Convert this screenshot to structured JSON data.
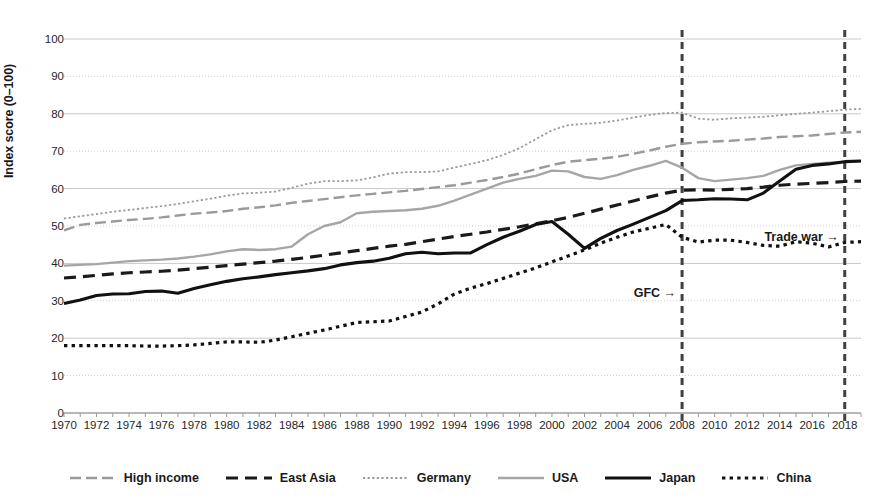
{
  "chart_data": {
    "type": "line",
    "title": "",
    "xlabel": "",
    "ylabel": "Index score (0–100)",
    "xlim": [
      1970,
      2019
    ],
    "ylim": [
      0,
      100
    ],
    "grid": true,
    "legend_position": "bottom",
    "x": [
      1970,
      1971,
      1972,
      1973,
      1974,
      1975,
      1976,
      1977,
      1978,
      1979,
      1980,
      1981,
      1982,
      1983,
      1984,
      1985,
      1986,
      1987,
      1988,
      1989,
      1990,
      1991,
      1992,
      1993,
      1994,
      1995,
      1996,
      1997,
      1998,
      1999,
      2000,
      2001,
      2002,
      2003,
      2004,
      2005,
      2006,
      2007,
      2008,
      2009,
      2010,
      2011,
      2012,
      2013,
      2014,
      2015,
      2016,
      2017,
      2018,
      2019
    ],
    "xticks": [
      1970,
      1972,
      1974,
      1976,
      1978,
      1980,
      1982,
      1984,
      1986,
      1988,
      1990,
      1992,
      1994,
      1996,
      1998,
      2000,
      2002,
      2004,
      2006,
      2008,
      2010,
      2012,
      2014,
      2016,
      2018
    ],
    "yticks": [
      0,
      10,
      20,
      30,
      40,
      50,
      60,
      70,
      80,
      90,
      100
    ],
    "series": [
      {
        "name": "High income",
        "style": "dash-long",
        "color": "#9a9a9a",
        "width": 2.4,
        "values": [
          48.8,
          50.3,
          50.8,
          51.2,
          51.6,
          51.9,
          52.3,
          52.8,
          53.3,
          53.6,
          54.0,
          54.6,
          55.0,
          55.5,
          56.2,
          56.7,
          57.2,
          57.7,
          58.2,
          58.6,
          59.0,
          59.4,
          59.9,
          60.4,
          60.9,
          61.6,
          62.3,
          63.1,
          64.0,
          65.2,
          66.3,
          67.2,
          67.6,
          68.0,
          68.5,
          69.3,
          70.2,
          71.2,
          72.0,
          72.4,
          72.6,
          72.8,
          73.1,
          73.4,
          73.8,
          74.0,
          74.2,
          74.6,
          75.0,
          75.2
        ]
      },
      {
        "name": "East Asia",
        "style": "dash-bold",
        "color": "#1a1a1a",
        "width": 3.2,
        "values": [
          36.1,
          36.4,
          36.8,
          37.2,
          37.5,
          37.7,
          37.9,
          38.2,
          38.6,
          39.0,
          39.4,
          39.8,
          40.2,
          40.6,
          41.1,
          41.6,
          42.2,
          42.8,
          43.4,
          44.0,
          44.6,
          45.1,
          45.8,
          46.5,
          47.2,
          47.8,
          48.4,
          49.1,
          49.8,
          50.6,
          51.4,
          52.3,
          53.4,
          54.5,
          55.6,
          56.7,
          57.8,
          58.8,
          59.6,
          59.7,
          59.6,
          59.8,
          60.0,
          60.4,
          60.9,
          61.2,
          61.4,
          61.6,
          61.9,
          62.0
        ]
      },
      {
        "name": "Germany",
        "style": "dot-fine",
        "color": "#9a9a9a",
        "width": 1.8,
        "values": [
          52.0,
          52.6,
          53.2,
          53.8,
          54.3,
          54.8,
          55.3,
          55.9,
          56.6,
          57.3,
          58.1,
          58.7,
          58.9,
          59.2,
          60.2,
          61.3,
          62.0,
          62.0,
          62.2,
          63.0,
          64.0,
          64.4,
          64.4,
          64.6,
          65.6,
          66.6,
          67.6,
          69.0,
          70.8,
          73.2,
          75.6,
          77.0,
          77.3,
          77.6,
          78.2,
          79.0,
          79.7,
          80.2,
          80.3,
          78.7,
          78.4,
          78.8,
          79.0,
          79.2,
          79.6,
          80.0,
          80.3,
          80.7,
          81.1,
          81.3
        ]
      },
      {
        "name": "USA",
        "style": "solid-grey",
        "color": "#a6a6a6",
        "width": 2.4,
        "values": [
          39.4,
          39.6,
          39.8,
          40.2,
          40.6,
          40.8,
          41.0,
          41.3,
          41.8,
          42.4,
          43.2,
          43.8,
          43.6,
          43.8,
          44.5,
          47.8,
          50.0,
          51.0,
          53.4,
          53.8,
          54.0,
          54.2,
          54.6,
          55.4,
          56.8,
          58.4,
          60.0,
          61.6,
          62.6,
          63.4,
          64.8,
          64.6,
          63.1,
          62.6,
          63.6,
          65.0,
          66.1,
          67.4,
          65.6,
          62.8,
          62.0,
          62.4,
          62.8,
          63.4,
          65.0,
          66.2,
          66.6,
          66.9,
          67.2,
          67.3
        ]
      },
      {
        "name": "Japan",
        "style": "solid-black",
        "color": "#111111",
        "width": 3.1,
        "values": [
          29.3,
          30.2,
          31.4,
          31.8,
          31.9,
          32.5,
          32.6,
          32.0,
          33.3,
          34.3,
          35.2,
          35.9,
          36.4,
          37.0,
          37.5,
          38.0,
          38.6,
          39.6,
          40.2,
          40.6,
          41.4,
          42.6,
          43.0,
          42.6,
          42.8,
          42.8,
          45.0,
          47.0,
          48.6,
          50.4,
          51.2,
          47.8,
          44.0,
          46.7,
          48.8,
          50.5,
          52.3,
          54.1,
          56.8,
          57.0,
          57.3,
          57.2,
          57.0,
          58.8,
          62.0,
          65.2,
          66.2,
          66.6,
          67.2,
          67.4
        ]
      },
      {
        "name": "China",
        "style": "dot-bold",
        "color": "#111111",
        "width": 3.2,
        "values": [
          18.0,
          18.0,
          18.0,
          18.0,
          18.0,
          17.9,
          17.9,
          18.0,
          18.2,
          18.6,
          19.0,
          19.0,
          18.9,
          19.5,
          20.4,
          21.3,
          22.2,
          23.2,
          24.2,
          24.4,
          24.6,
          25.8,
          27.0,
          29.2,
          31.8,
          33.4,
          34.6,
          36.0,
          37.4,
          38.8,
          40.4,
          42.0,
          43.6,
          45.4,
          47.0,
          48.4,
          49.4,
          50.4,
          47.0,
          45.7,
          46.2,
          46.2,
          45.6,
          44.8,
          44.6,
          45.8,
          45.4,
          44.4,
          45.6,
          45.8
        ]
      }
    ],
    "annotations": [
      {
        "text": "GFC →",
        "x": 2008,
        "y": 32,
        "vline": true
      },
      {
        "text": "Trade war →",
        "x": 2018,
        "y": 47,
        "vline": true
      }
    ],
    "vlines": [
      {
        "x": 2008,
        "color": "#404040",
        "style": "dashed"
      },
      {
        "x": 2018,
        "color": "#404040",
        "style": "dashed"
      }
    ]
  }
}
